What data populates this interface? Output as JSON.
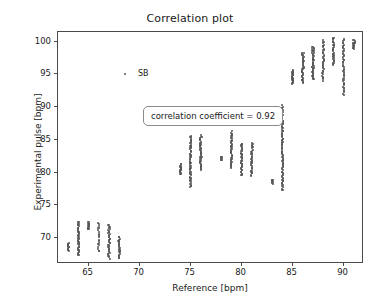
{
  "chart_data": {
    "type": "scatter",
    "title": "Correlation plot",
    "xlabel": "Reference [bpm]",
    "ylabel": "Experimental pulse [bpm]",
    "xlim": [
      62.0,
      92.0
    ],
    "ylim": [
      66.0,
      101.5
    ],
    "xticks": [
      65,
      70,
      75,
      80,
      85,
      90
    ],
    "xticklabels": [
      "65",
      "70",
      "75",
      "80",
      "85",
      "90"
    ],
    "yticks": [
      70,
      75,
      80,
      85,
      90,
      95,
      100
    ],
    "yticklabels": [
      "70",
      "75",
      "80",
      "85",
      "90",
      "95",
      "100"
    ],
    "grid": false,
    "legend": {
      "position": "upper left",
      "entries": [
        {
          "name": "SB",
          "marker": "point",
          "color": "#555555"
        }
      ]
    },
    "annotations": [
      {
        "text": "correlation coefficient = 0.92",
        "x": 66.5,
        "y": 95.0,
        "boxed": true
      }
    ],
    "marker_color": "#555555",
    "marker_size": 2,
    "series": [
      {
        "name": "SB",
        "columns": [
          {
            "x": 63,
            "y_min": 68.1,
            "y_max": 69.2,
            "n": 14
          },
          {
            "x": 64,
            "y_min": 67.3,
            "y_max": 72.5,
            "n": 42
          },
          {
            "x": 65,
            "y_min": 71.3,
            "y_max": 72.4,
            "n": 16
          },
          {
            "x": 66,
            "y_min": 67.9,
            "y_max": 72.3,
            "n": 20
          },
          {
            "x": 67,
            "y_min": 66.9,
            "y_max": 72.0,
            "n": 40
          },
          {
            "x": 68,
            "y_min": 66.9,
            "y_max": 70.2,
            "n": 26
          },
          {
            "x": 74,
            "y_min": 79.7,
            "y_max": 81.3,
            "n": 18
          },
          {
            "x": 75,
            "y_min": 77.8,
            "y_max": 85.6,
            "n": 60
          },
          {
            "x": 76,
            "y_min": 80.4,
            "y_max": 85.6,
            "n": 44
          },
          {
            "x": 78,
            "y_min": 81.9,
            "y_max": 82.4,
            "n": 8
          },
          {
            "x": 79,
            "y_min": 80.7,
            "y_max": 86.2,
            "n": 44
          },
          {
            "x": 80,
            "y_min": 79.5,
            "y_max": 84.5,
            "n": 40
          },
          {
            "x": 81,
            "y_min": 79.5,
            "y_max": 84.5,
            "n": 36
          },
          {
            "x": 83,
            "y_min": 78.3,
            "y_max": 78.9,
            "n": 8
          },
          {
            "x": 84,
            "y_min": 77.3,
            "y_max": 90.2,
            "n": 90
          },
          {
            "x": 85,
            "y_min": 93.6,
            "y_max": 95.6,
            "n": 26
          },
          {
            "x": 86,
            "y_min": 93.7,
            "y_max": 98.4,
            "n": 42
          },
          {
            "x": 87,
            "y_min": 94.3,
            "y_max": 99.3,
            "n": 48
          },
          {
            "x": 88,
            "y_min": 94.1,
            "y_max": 100.2,
            "n": 40
          },
          {
            "x": 89,
            "y_min": 96.5,
            "y_max": 100.6,
            "n": 34
          },
          {
            "x": 90,
            "y_min": 91.9,
            "y_max": 100.4,
            "n": 50
          },
          {
            "x": 91,
            "y_min": 99.0,
            "y_max": 100.3,
            "n": 16
          }
        ]
      }
    ]
  },
  "chart": {
    "title": "Correlation plot",
    "xlabel": "Reference [bpm]",
    "ylabel": "Experimental pulse [bpm]",
    "legend_label": "SB",
    "annotation": "correlation coefficient = 0.92"
  }
}
